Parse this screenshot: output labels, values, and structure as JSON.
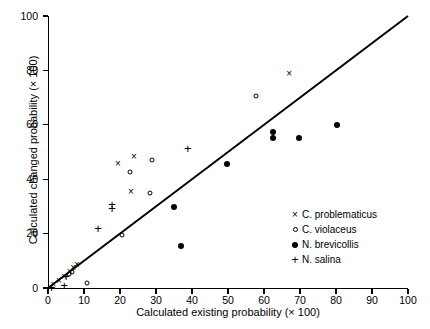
{
  "chart_data": {
    "type": "scatter",
    "title": "",
    "xlabel": "Calculated existing probability (× 100)",
    "ylabel": "Calculated changed probability (× 100)",
    "xlim": [
      0,
      100
    ],
    "ylim": [
      0,
      100
    ],
    "xticks": [
      0,
      10,
      20,
      30,
      40,
      50,
      60,
      70,
      80,
      90,
      100
    ],
    "yticks": [
      0,
      20,
      40,
      60,
      80,
      100
    ],
    "grid": false,
    "legend_position": "lower-right-inside",
    "reference_line": {
      "name": "identity-line",
      "from": [
        0,
        0
      ],
      "to": [
        100,
        100
      ],
      "style": "solid",
      "color": "#000000"
    },
    "series": [
      {
        "name": "C. problematicus",
        "marker": "x",
        "color": "#000000",
        "points": [
          [
            1.5,
            1.0
          ],
          [
            3.0,
            2.5
          ],
          [
            4.5,
            4.0
          ],
          [
            6.0,
            6.0
          ],
          [
            7.0,
            7.5
          ],
          [
            8.0,
            8.5
          ],
          [
            19.4,
            45.7
          ],
          [
            23.9,
            48.0
          ],
          [
            23.0,
            35.3
          ],
          [
            67.0,
            78.5
          ]
        ]
      },
      {
        "name": "C. violaceus",
        "marker": "o",
        "color": "#000000",
        "points": [
          [
            5.8,
            5.0
          ],
          [
            6.8,
            6.0
          ],
          [
            10.8,
            2.0
          ],
          [
            20.6,
            19.4
          ],
          [
            22.8,
            42.5
          ],
          [
            28.3,
            35.0
          ],
          [
            28.9,
            47.2
          ],
          [
            57.8,
            70.5
          ]
        ]
      },
      {
        "name": "N. brevicollis",
        "marker": "filled-circle",
        "color": "#000000",
        "points": [
          [
            35.0,
            29.7
          ],
          [
            37.0,
            15.5
          ],
          [
            49.7,
            45.7
          ],
          [
            62.6,
            57.5
          ],
          [
            62.6,
            55.0
          ],
          [
            69.7,
            55.0
          ],
          [
            80.3,
            60.0
          ]
        ]
      },
      {
        "name": "N. salina",
        "marker": "+",
        "color": "#000000",
        "points": [
          [
            1.0,
            0.5
          ],
          [
            4.5,
            1.0
          ],
          [
            5.0,
            4.5
          ],
          [
            13.9,
            22.2
          ],
          [
            17.8,
            29.4
          ],
          [
            17.8,
            31.0
          ],
          [
            38.8,
            51.5
          ]
        ]
      }
    ],
    "legend": [
      {
        "symbol": "×",
        "marker": "x",
        "label": "C. problematicus"
      },
      {
        "symbol": "○",
        "marker": "o",
        "label": "C. violaceus"
      },
      {
        "symbol": "●",
        "marker": "filled-circle",
        "label": "N. brevicollis"
      },
      {
        "symbol": "+",
        "marker": "+",
        "label": "N. salina"
      }
    ]
  }
}
